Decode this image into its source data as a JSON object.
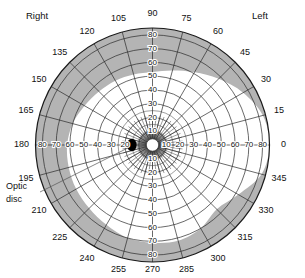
{
  "orientation": {
    "left_side_label": "Right",
    "right_side_label": "Left"
  },
  "annotations": {
    "optic_disc": {
      "line1": "Optic",
      "line2": "disc"
    }
  },
  "colors": {
    "seen_field": "#ffffff",
    "blind_area": "#b4b4b4",
    "grid": "#2a2a2a",
    "blind_spot": "#000000",
    "text": "#111111",
    "background": "#ffffff"
  },
  "chart_data": {
    "type": "polar",
    "xlabel": "Meridian (degrees)",
    "ylabel": "Eccentricity (degrees)",
    "grid": true,
    "legend": "none",
    "meridian_step_deg": 15,
    "meridian_labels": [
      "0",
      "15",
      "30",
      "45",
      "60",
      "75",
      "90",
      "105",
      "120",
      "135",
      "150",
      "165",
      "180",
      "195",
      "210",
      "225",
      "240",
      "255",
      "270",
      "285",
      "300",
      "315",
      "330",
      "345"
    ],
    "radial_rings_deg": [
      10,
      20,
      30,
      40,
      50,
      60,
      70,
      80
    ],
    "rlim": [
      0,
      85
    ],
    "axis_tick_labels": {
      "right_horizontal": [
        "10",
        "20",
        "30",
        "40",
        "50",
        "60",
        "70",
        "80"
      ],
      "left_horizontal": [
        "20",
        "30",
        "40",
        "50",
        "60",
        "70",
        "80"
      ],
      "up_vertical": [
        "10",
        "20",
        "30",
        "40",
        "50",
        "60",
        "70",
        "80"
      ],
      "down_vertical": [
        "10",
        "20",
        "30",
        "40",
        "50",
        "60",
        "70",
        "80"
      ]
    },
    "field_boundary": {
      "description": "Outer limit of the seeing (white) visual field by meridian",
      "angles_deg": [
        0,
        15,
        30,
        45,
        60,
        75,
        90,
        105,
        120,
        135,
        150,
        165,
        180,
        195,
        210,
        225,
        240,
        255,
        270,
        285,
        300,
        315,
        330,
        345
      ],
      "radii_deg": [
        88,
        83,
        76,
        68,
        61,
        56,
        53,
        53,
        54,
        55,
        57,
        60,
        62,
        63,
        64,
        65,
        67,
        70,
        71,
        72,
        70,
        66,
        72,
        82
      ]
    },
    "blind_spot": {
      "label": "Optic disc",
      "meridian_deg": 180,
      "eccentricity_deg": 15,
      "width_deg": 7,
      "height_deg": 9,
      "filled": true
    },
    "fixation_point": {
      "eccentricity_deg": 0,
      "radius_deg": 4.5
    }
  }
}
